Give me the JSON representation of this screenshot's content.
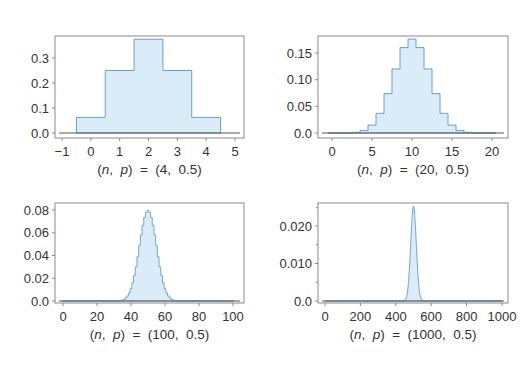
{
  "figure": {
    "background": "#ffffff",
    "fill_color": "#d9ecf7",
    "stroke_color": "#6a9ec7",
    "frame_color": "#8a8a8a",
    "baseline_color": "#555555"
  },
  "chart_data": [
    {
      "id": "binom-4",
      "type": "bar",
      "style": "step-histogram",
      "title": "",
      "caption": "(n,  p)  =  (4,  0.5)",
      "n": 4,
      "p": 0.5,
      "xlabel": "(n, p) = (4, 0.5)",
      "ylabel": "",
      "x": [
        0,
        1,
        2,
        3,
        4
      ],
      "values": [
        0.0625,
        0.25,
        0.375,
        0.25,
        0.0625
      ],
      "xlim": [
        -1,
        5
      ],
      "ylim": [
        0,
        0.39
      ],
      "xticks": [
        -1,
        0,
        1,
        2,
        3,
        4,
        5
      ],
      "xtick_labels": [
        "−1",
        "0",
        "1",
        "2",
        "3",
        "4",
        "5"
      ],
      "yticks": [
        0.0,
        0.1,
        0.2,
        0.3
      ],
      "ytick_labels": [
        "0.0",
        "0.1",
        "0.2",
        "0.3"
      ],
      "grid": false,
      "legend": null,
      "frame": {
        "left": 55,
        "top": 36,
        "right": 244,
        "bottom": 138
      },
      "axis_map": {
        "x0": 62,
        "x1": 235,
        "xv0": -1,
        "xv1": 5,
        "y0": 133,
        "yscale": 250
      }
    },
    {
      "id": "binom-20",
      "type": "bar",
      "style": "step-histogram",
      "title": "",
      "caption": "(n,  p)  =  (20,  0.5)",
      "n": 20,
      "p": 0.5,
      "xlabel": "(n, p) = (20, 0.5)",
      "ylabel": "",
      "x": [
        0,
        1,
        2,
        3,
        4,
        5,
        6,
        7,
        8,
        9,
        10,
        11,
        12,
        13,
        14,
        15,
        16,
        17,
        18,
        19,
        20
      ],
      "values": [
        1e-06,
        1.9e-05,
        0.000181,
        0.001087,
        0.004621,
        0.014786,
        0.036964,
        0.073929,
        0.120134,
        0.160179,
        0.176197,
        0.160179,
        0.120134,
        0.073929,
        0.036964,
        0.014786,
        0.004621,
        0.001087,
        0.000181,
        1.9e-05,
        1e-06
      ],
      "xlim": [
        -1,
        21
      ],
      "ylim": [
        0,
        0.18
      ],
      "xticks": [
        0,
        5,
        10,
        15,
        20
      ],
      "xtick_labels": [
        "0",
        "5",
        "10",
        "15",
        "20"
      ],
      "yticks": [
        0.0,
        0.05,
        0.1,
        0.15
      ],
      "ytick_labels": [
        "0.0",
        "0.05",
        "0.10",
        "0.15"
      ],
      "grid": false,
      "legend": null,
      "frame": {
        "left": 318,
        "top": 36,
        "right": 508,
        "bottom": 138
      },
      "axis_map": {
        "x0": 332,
        "x1": 492,
        "xv0": 0,
        "xv1": 20,
        "y0": 133,
        "yscale": 533
      }
    },
    {
      "id": "binom-100",
      "type": "bar",
      "style": "step-histogram",
      "title": "",
      "caption": "(n,  p)  =  (100,  0.5)",
      "n": 100,
      "p": 0.5,
      "xlabel": "(n, p) = (100, 0.5)",
      "ylabel": "",
      "x_range": [
        0,
        100
      ],
      "values_note": "Binomial(100, 0.5) pmf; peak 0.0796 at x = 50",
      "peak": {
        "x": 50,
        "y": 0.0796
      },
      "xlim": [
        -3,
        103
      ],
      "ylim": [
        0,
        0.082
      ],
      "xticks": [
        0,
        20,
        40,
        60,
        80,
        100
      ],
      "xtick_labels": [
        "0",
        "20",
        "40",
        "60",
        "80",
        "100"
      ],
      "yticks": [
        0.0,
        0.02,
        0.04,
        0.06,
        0.08
      ],
      "ytick_labels": [
        "0.0",
        "0.02",
        "0.04",
        "0.06",
        "0.08"
      ],
      "grid": false,
      "legend": null,
      "frame": {
        "left": 55,
        "top": 203,
        "right": 244,
        "bottom": 303
      },
      "axis_map": {
        "x0": 63,
        "x1": 233,
        "xv0": 0,
        "xv1": 100,
        "y0": 301,
        "yscale": 1137
      }
    },
    {
      "id": "binom-1000",
      "type": "bar",
      "style": "step-histogram",
      "title": "",
      "caption": "(n,  p)  =  (1000,  0.5)",
      "n": 1000,
      "p": 0.5,
      "xlabel": "(n, p) = (1000, 0.5)",
      "ylabel": "",
      "x_range": [
        0,
        1000
      ],
      "values_note": "Binomial(1000, 0.5) pmf; peak 0.0252 at x = 500",
      "peak": {
        "x": 500,
        "y": 0.0252
      },
      "xlim": [
        -20,
        1020
      ],
      "ylim": [
        0,
        0.026
      ],
      "xticks": [
        0,
        200,
        400,
        600,
        800,
        1000
      ],
      "xtick_labels": [
        "0",
        "200",
        "400",
        "600",
        "800",
        "1000"
      ],
      "yticks": [
        0.0,
        0.01,
        0.02
      ],
      "ytick_labels": [
        "0.0",
        "0.010",
        "0.020"
      ],
      "minor_yticks": [
        0.005,
        0.015,
        0.025
      ],
      "grid": false,
      "legend": null,
      "frame": {
        "left": 318,
        "top": 203,
        "right": 508,
        "bottom": 303
      },
      "axis_map": {
        "x0": 325,
        "x1": 502,
        "xv0": 0,
        "xv1": 1000,
        "y0": 301,
        "yscale": 3750
      }
    }
  ]
}
